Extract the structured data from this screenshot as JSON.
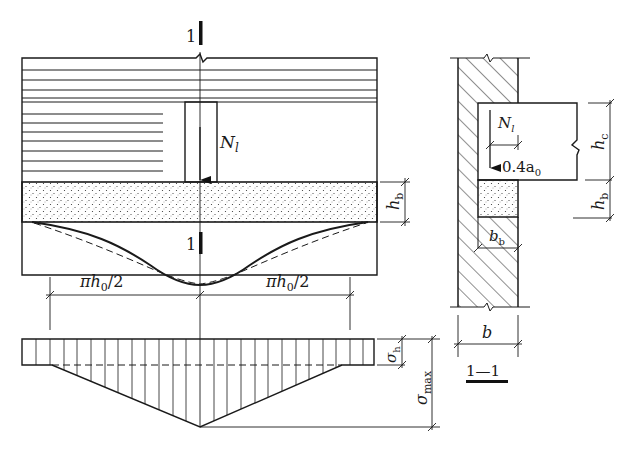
{
  "figure": {
    "section_mark": "1",
    "section_title": "1—1",
    "labels": {
      "load": "N",
      "load_sub": "l",
      "pad_height": "h",
      "pad_height_sub": "b",
      "spread_left": "πh",
      "spread_left_sub": "0",
      "spread_left_suffix": "/2",
      "spread_right": "πh",
      "spread_right_sub": "0",
      "spread_right_suffix": "/2",
      "sigma_h": "σ",
      "sigma_h_sub": "h",
      "sigma_max": "σ",
      "sigma_max_sub": "max",
      "beam_height": "h",
      "beam_height_sub": "c",
      "eccentricity": "0.4a",
      "eccentricity_sub": "0",
      "pad_width": "b",
      "pad_width_sub": "b",
      "wall_thickness": "b"
    },
    "colors": {
      "line": "#1a1a1a",
      "background": "#ffffff"
    }
  }
}
